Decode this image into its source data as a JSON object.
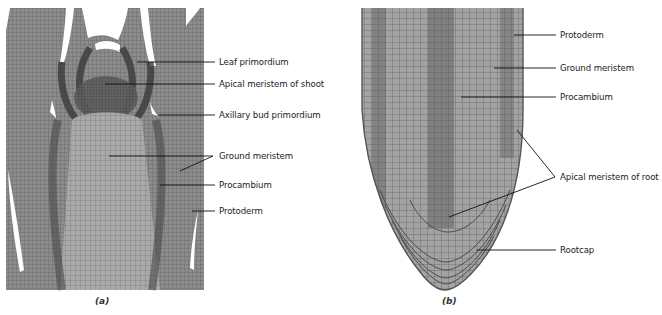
{
  "panels": [
    {
      "id": "a",
      "caption": "(a)",
      "subject": "Shoot apex longitudinal section",
      "labels": [
        {
          "text": "Leaf primordium",
          "x": 219,
          "y": 62
        },
        {
          "text": "Apical meristem of shoot",
          "x": 219,
          "y": 84
        },
        {
          "text": "Axillary bud primordium",
          "x": 219,
          "y": 115
        },
        {
          "text": "Ground meristem",
          "x": 219,
          "y": 156
        },
        {
          "text": "Procambium",
          "x": 219,
          "y": 185
        },
        {
          "text": "Protoderm",
          "x": 219,
          "y": 211
        }
      ]
    },
    {
      "id": "b",
      "caption": "(b)",
      "subject": "Root tip longitudinal section",
      "labels": [
        {
          "text": "Protoderm",
          "x": 560,
          "y": 35
        },
        {
          "text": "Ground meristem",
          "x": 560,
          "y": 68
        },
        {
          "text": "Procambium",
          "x": 560,
          "y": 97
        },
        {
          "text": "Apical meristem of root",
          "x": 560,
          "y": 177
        },
        {
          "text": "Rootcap",
          "x": 560,
          "y": 250
        }
      ]
    }
  ],
  "colors": {
    "tissue_dark": "#4a4a4a",
    "tissue_mid": "#7a7a7a",
    "tissue_light": "#a8a8a8",
    "root_fill": "#9a9a9a",
    "leader_line": "#111111",
    "background": "#ffffff"
  }
}
